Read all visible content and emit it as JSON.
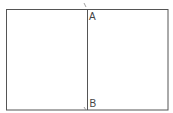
{
  "diagram": {
    "type": "rectangle-with-vertical-segment",
    "colors": {
      "stroke": "#555555",
      "label": "#444444",
      "background": "#ffffff"
    },
    "rectangle": {
      "x": 6,
      "y": 9,
      "width": 162,
      "height": 101
    },
    "segment": {
      "x": 87,
      "y1": 9,
      "y2": 110
    },
    "points": [
      {
        "id": "A",
        "label": "A",
        "x": 87,
        "y": 9
      },
      {
        "id": "B",
        "label": "B",
        "x": 87,
        "y": 110
      }
    ]
  }
}
